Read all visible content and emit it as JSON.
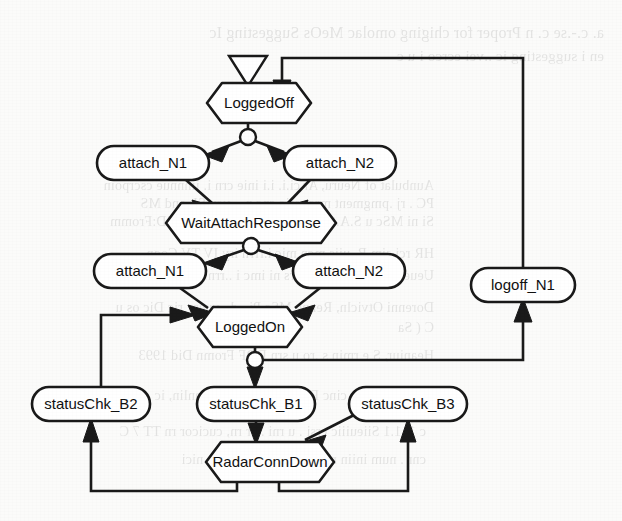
{
  "page": {
    "kind": "scanned-state-diagram",
    "width": 622,
    "height": 521,
    "background_color": "#fbfbfa",
    "ink_color": "#1a1a1a"
  },
  "diagram": {
    "title": "",
    "type": "state-transition-diagram",
    "start_marker": {
      "name": "start-triangle",
      "x": 248,
      "y": 72
    },
    "states": [
      {
        "id": "loggedoff",
        "label": "LoggedOff",
        "shape": "hexagon",
        "cx": 259,
        "cy": 103,
        "w": 104,
        "h": 40
      },
      {
        "id": "waitattachresp",
        "label": "WaitAttachResponse",
        "shape": "hexagon",
        "cx": 251,
        "cy": 223,
        "w": 170,
        "h": 40
      },
      {
        "id": "loggedon",
        "label": "LoggedOn",
        "shape": "hexagon",
        "cx": 250,
        "cy": 327,
        "w": 104,
        "h": 40
      },
      {
        "id": "radarconndown",
        "label": "RadarConnDown",
        "shape": "hexagon",
        "cx": 270,
        "cy": 462,
        "w": 128,
        "h": 40
      }
    ],
    "actions": [
      {
        "id": "attach_n1_a",
        "label": "attach_N1",
        "shape": "stadium",
        "cx": 153,
        "cy": 163,
        "w": 112,
        "h": 34
      },
      {
        "id": "attach_n2_a",
        "label": "attach_N2",
        "shape": "stadium",
        "cx": 340,
        "cy": 163,
        "w": 112,
        "h": 34
      },
      {
        "id": "attach_n1_b",
        "label": "attach_N1",
        "shape": "stadium",
        "cx": 150,
        "cy": 271,
        "w": 112,
        "h": 34
      },
      {
        "id": "attach_n2_b",
        "label": "attach_N2",
        "shape": "stadium",
        "cx": 349,
        "cy": 271,
        "w": 112,
        "h": 34
      },
      {
        "id": "logoff_n1",
        "label": "logoff_N1",
        "shape": "stadium",
        "cx": 523,
        "cy": 285,
        "w": 104,
        "h": 34
      },
      {
        "id": "statuschk_b2",
        "label": "statusChk_B2",
        "shape": "stadium",
        "cx": 91,
        "cy": 404,
        "w": 118,
        "h": 34
      },
      {
        "id": "statuschk_b1",
        "label": "statusChk_B1",
        "shape": "stadium",
        "cx": 256,
        "cy": 404,
        "w": 118,
        "h": 34
      },
      {
        "id": "statuschk_b3",
        "label": "statusChk_B3",
        "shape": "stadium",
        "cx": 408,
        "cy": 404,
        "w": 118,
        "h": 34
      }
    ],
    "junctions": [
      {
        "id": "j1",
        "cx": 248,
        "cy": 137,
        "r": 8
      },
      {
        "id": "j2",
        "cx": 251,
        "cy": 246,
        "r": 8
      },
      {
        "id": "j3",
        "cx": 255,
        "cy": 360,
        "r": 8
      }
    ],
    "transitions": [
      {
        "from": "start",
        "to": "loggedoff"
      },
      {
        "from": "loggedoff",
        "to": "j1"
      },
      {
        "from": "j1",
        "to": "attach_N1 (upper)"
      },
      {
        "from": "j1",
        "to": "attach_N2 (upper)"
      },
      {
        "from": "attach_N1 (upper)",
        "to": "WaitAttachResponse"
      },
      {
        "from": "attach_N2 (upper)",
        "to": "WaitAttachResponse"
      },
      {
        "from": "WaitAttachResponse",
        "to": "j2"
      },
      {
        "from": "j2",
        "to": "attach_N1 (lower)"
      },
      {
        "from": "j2",
        "to": "attach_N2 (lower)"
      },
      {
        "from": "attach_N1 (lower)",
        "to": "LoggedOn"
      },
      {
        "from": "attach_N2 (lower)",
        "to": "LoggedOn"
      },
      {
        "from": "LoggedOn",
        "to": "j3"
      },
      {
        "from": "j3",
        "to": "statusChk_B1"
      },
      {
        "from": "j3",
        "to": "logoff_N1"
      },
      {
        "from": "logoff_N1",
        "to": "LoggedOff (right loop)"
      },
      {
        "from": "statusChk_B1",
        "to": "RadarConnDown"
      },
      {
        "from": "statusChk_B3",
        "to": "RadarConnDown"
      },
      {
        "from": "RadarConnDown",
        "to": "statusChk_B2 (bottom left loop)"
      },
      {
        "from": "RadarConnDown",
        "to": "statusChk_B3 (bottom right loop)"
      },
      {
        "from": "statusChk_B2",
        "to": "LoggedOn (left loop)"
      }
    ]
  },
  "bleed_through": {
    "note": "faint mirrored text from reverse page",
    "lines": [
      {
        "text": "a. c.-.se c. n Proper for chiging omolac  MeOs Suggesting Ic",
        "x": 18,
        "y": 24,
        "size": 16
      },
      {
        "text": "en i suggesting  ic ..vei  ecrco  i  u c",
        "x": 18,
        "y": 48,
        "size": 15
      },
      {
        "text": "Aunbulat of  Neuru,  Ar.ci.i.  i.i inie  crn  i.  iinnnue  cscrpoin",
        "x": 188,
        "y": 178,
        "size": 14
      },
      {
        "text": "PC . rj .pmgment mroverio  rnc  n  ..  vcy  SI.  and  MS",
        "x": 188,
        "y": 196,
        "size": 14
      },
      {
        "text": "Si ni MSc  u  S.A.C.o, Procesoin  ii.  Brevet di.SD:Fromm",
        "x": 188,
        "y": 214,
        "size": 14
      },
      {
        "text": "HR  rci  sim  B.  uiis  mcn  mic  i.rrrn  iry  IV  TV  Cogn",
        "x": 188,
        "y": 246,
        "size": 14
      },
      {
        "text": "Ueues  .ni  rrnscarrsio  S  .rs  ni  imc  i  ..rrnin,  Ueeri,",
        "x": 188,
        "y": 268,
        "size": 14
      },
      {
        "text": "Dorenni Otvicln, Renne MSc  Pi  ..d  . vuery  ric  Dic  os u",
        "x": 188,
        "y": 300,
        "size": 14
      },
      {
        "text": "C (  Sa",
        "x": 188,
        "y": 320,
        "size": 14
      },
      {
        "text": "Heaniur, S  e rmin s  .ro  u  srn DDF  Fromn  Did  1993",
        "x": 188,
        "y": 348,
        "size": 14
      },
      {
        "text": "wil . 1.7  Ric cinc  Ennui,  rrr  er  AC  Muanlin,  ic",
        "x": 200,
        "y": 388,
        "size": 14
      },
      {
        "text": "c  1. 1.1  Siieuiiic  crsi  . u rni  .  cr rn, cucicor  rn  TT  7  C",
        "x": 196,
        "y": 424,
        "size": 14
      },
      {
        "text": "cnr  . num  iniin  ri  rri  Sennen  uuir  .  rnn  nici",
        "x": 196,
        "y": 452,
        "size": 14
      }
    ]
  }
}
